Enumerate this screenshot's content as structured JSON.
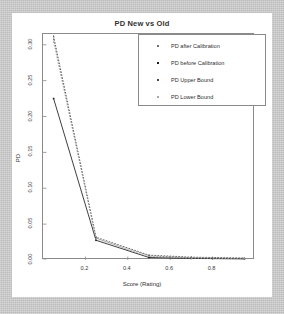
{
  "chart_data": {
    "type": "line",
    "title": "PD New vs Old",
    "xlabel": "Score (Rating)",
    "ylabel": "PD",
    "xlim": [
      0.0,
      1.0
    ],
    "ylim": [
      0.0,
      0.315
    ],
    "grid": false,
    "legend_position": "top-right",
    "xticks": [
      "0.2",
      "0.4",
      "0.6",
      "0.8"
    ],
    "xtick_values": [
      0.2,
      0.4,
      0.6,
      0.8
    ],
    "yticks": [
      "0.00",
      "0.05",
      "0.10",
      "0.15",
      "0.20",
      "0.25",
      "0.30"
    ],
    "ytick_values": [
      0.0,
      0.05,
      0.1,
      0.15,
      0.2,
      0.25,
      0.3
    ],
    "x": [
      0.05,
      0.25,
      0.5,
      0.7,
      0.95
    ],
    "series": [
      {
        "name": "PD after Calibration",
        "marker": "square-small",
        "color": "#6e6e6e",
        "style": "dashed",
        "values": [
          0.308,
          0.0305,
          0.0058,
          0.0032,
          0.0022
        ]
      },
      {
        "name": "PD before Calibration",
        "marker": "square-filled",
        "color": "#1c1c1c",
        "style": "solid",
        "values": [
          0.225,
          0.0275,
          0.0035,
          0.0022,
          0.0015
        ]
      },
      {
        "name": "PD Upper Bound",
        "marker": "square-small",
        "color": "#4a4a4a",
        "style": "dashed",
        "values": [
          0.312,
          0.0318,
          0.0068,
          0.004,
          0.0028
        ]
      },
      {
        "name": "PD Lower Bound",
        "marker": "square-small",
        "color": "#a8a8a8",
        "style": "dashed",
        "values": [
          0.304,
          0.0292,
          0.005,
          0.0026,
          0.0018
        ]
      }
    ]
  },
  "legend": {
    "items": [
      {
        "label": "PD after Calibration"
      },
      {
        "label": "PD before Calibration"
      },
      {
        "label": "PD Upper Bound"
      },
      {
        "label": "PD Lower Bound"
      }
    ]
  }
}
